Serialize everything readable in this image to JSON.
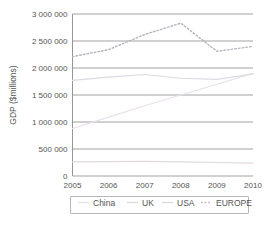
{
  "chart_data": {
    "type": "line",
    "title": "",
    "xlabel": "",
    "ylabel": "GDP ($millions)",
    "x": [
      2005,
      2006,
      2007,
      2008,
      2009,
      2010
    ],
    "xtick_labels": [
      "2005",
      "2006",
      "2007",
      "2008",
      "2009",
      "2010"
    ],
    "ytick_labels": [
      "0",
      "500 000",
      "1 000 000",
      "1 500 000",
      "2 000 000",
      "2 500 000",
      "3 000 000"
    ],
    "ytick_values": [
      0,
      500000,
      1000000,
      1500000,
      2000000,
      2500000,
      3000000
    ],
    "ylim": [
      0,
      3000000
    ],
    "xlim": [
      2005,
      2010
    ],
    "grid": true,
    "legend_position": "bottom",
    "series": [
      {
        "name": "China",
        "color": "#e8e0ea",
        "style": "solid",
        "values": [
          880000,
          1090000,
          1300000,
          1500000,
          1700000,
          1900000
        ]
      },
      {
        "name": "UK",
        "color": "#e3d7de",
        "style": "solid",
        "values": [
          260000,
          265000,
          270000,
          262000,
          250000,
          240000
        ]
      },
      {
        "name": "USA",
        "color": "#ddd9e2",
        "style": "solid",
        "values": [
          1770000,
          1830000,
          1880000,
          1810000,
          1790000,
          1890000
        ]
      },
      {
        "name": "EUROPE",
        "color": "#b9b2bd",
        "style": "dotted",
        "values": [
          2210000,
          2340000,
          2620000,
          2830000,
          2310000,
          2400000
        ]
      }
    ]
  },
  "legend": {
    "items": [
      {
        "label": "China",
        "color": "#e8e0ea",
        "style": "solid"
      },
      {
        "label": "UK",
        "color": "#e3d7de",
        "style": "solid"
      },
      {
        "label": "USA",
        "color": "#ddd9e2",
        "style": "solid"
      },
      {
        "label": "EUROPE",
        "color": "#b9b2bd",
        "style": "dotted"
      }
    ]
  },
  "colors": {
    "grid": "#8a8a8a",
    "text": "#555555",
    "background": "#ffffff",
    "legend_border": "#9a9a9a"
  }
}
